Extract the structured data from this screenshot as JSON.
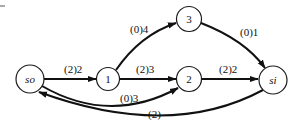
{
  "diagram": {
    "type": "flow-network",
    "nodes": [
      {
        "id": "so",
        "label": "so",
        "italic": true
      },
      {
        "id": "1",
        "label": "1",
        "italic": false
      },
      {
        "id": "3",
        "label": "3",
        "italic": false
      },
      {
        "id": "2",
        "label": "2",
        "italic": false
      },
      {
        "id": "si",
        "label": "si",
        "italic": true
      }
    ],
    "edges": [
      {
        "from": "so",
        "to": "1",
        "label": "(2)2"
      },
      {
        "from": "1",
        "to": "3",
        "label": "(0)4"
      },
      {
        "from": "1",
        "to": "2",
        "label": "(2)3"
      },
      {
        "from": "3",
        "to": "si",
        "label": "(0)1"
      },
      {
        "from": "2",
        "to": "si",
        "label": "(2)2"
      },
      {
        "from": "so",
        "to": "2",
        "label": "(0)3"
      },
      {
        "from": "si",
        "to": "so",
        "label": "(2)"
      }
    ],
    "colors": {
      "stroke": "#111111",
      "background": "#ffffff"
    }
  }
}
